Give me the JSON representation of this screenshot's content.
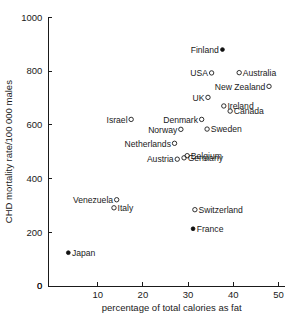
{
  "chart_data": {
    "type": "scatter",
    "title": "",
    "xlabel": "percentage of total calories as fat",
    "ylabel": "CHD mortality rate/100 000 males",
    "xlim": [
      0,
      50
    ],
    "ylim": [
      0,
      1000
    ],
    "xticks": [
      0,
      10,
      20,
      30,
      40,
      50
    ],
    "yticks": [
      0,
      200,
      400,
      600,
      800,
      1000
    ],
    "xtick_labels": [
      "0",
      "10",
      "20",
      "30",
      "40",
      "50"
    ],
    "ytick_labels": [
      "0",
      "200",
      "400",
      "600",
      "800",
      "1000"
    ],
    "grid": false,
    "legend": "none",
    "marker_styles": {
      "open": "open-circle",
      "filled": "filled-circle"
    },
    "points": [
      {
        "label": "Finland",
        "x": 37.6,
        "y": 880,
        "marker": "filled",
        "label_pos": "left"
      },
      {
        "label": "USA",
        "x": 35.2,
        "y": 793,
        "marker": "open",
        "label_pos": "left"
      },
      {
        "label": "Australia",
        "x": 41.3,
        "y": 794,
        "marker": "open",
        "label_pos": "right"
      },
      {
        "label": "New Zealand",
        "x": 47.9,
        "y": 743,
        "marker": "open",
        "label_pos": "left"
      },
      {
        "label": "UK",
        "x": 34.4,
        "y": 702,
        "marker": "open",
        "label_pos": "left"
      },
      {
        "label": "Ireland",
        "x": 37.9,
        "y": 670,
        "marker": "open",
        "label_pos": "right"
      },
      {
        "label": "Canada",
        "x": 39.3,
        "y": 651,
        "marker": "open",
        "label_pos": "right"
      },
      {
        "label": "Israel",
        "x": 17.4,
        "y": 620,
        "marker": "open",
        "label_pos": "left"
      },
      {
        "label": "Denmark",
        "x": 33.0,
        "y": 620,
        "marker": "open",
        "label_pos": "left"
      },
      {
        "label": "Norway",
        "x": 28.4,
        "y": 583,
        "marker": "open",
        "label_pos": "left"
      },
      {
        "label": "Sweden",
        "x": 34.2,
        "y": 584,
        "marker": "open",
        "label_pos": "right"
      },
      {
        "label": "Netherlands",
        "x": 27.0,
        "y": 531,
        "marker": "open",
        "label_pos": "left"
      },
      {
        "label": "Belgium",
        "x": 29.8,
        "y": 485,
        "marker": "open",
        "label_pos": "right"
      },
      {
        "label": "Germany",
        "x": 29.1,
        "y": 477,
        "marker": "open",
        "label_pos": "right"
      },
      {
        "label": "Austria",
        "x": 27.6,
        "y": 472,
        "marker": "open",
        "label_pos": "left"
      },
      {
        "label": "Venezuela",
        "x": 14.2,
        "y": 321,
        "marker": "open",
        "label_pos": "left"
      },
      {
        "label": "Italy",
        "x": 13.6,
        "y": 291,
        "marker": "open",
        "label_pos": "right"
      },
      {
        "label": "Switzerland",
        "x": 31.5,
        "y": 284,
        "marker": "open",
        "label_pos": "right"
      },
      {
        "label": "France",
        "x": 31.1,
        "y": 213,
        "marker": "filled",
        "label_pos": "right"
      },
      {
        "label": "Japan",
        "x": 3.5,
        "y": 124,
        "marker": "filled",
        "label_pos": "right"
      }
    ]
  },
  "colors": {
    "axis": "#1a1a1a",
    "marker": "#1a1a1a",
    "background": "#ffffff"
  }
}
